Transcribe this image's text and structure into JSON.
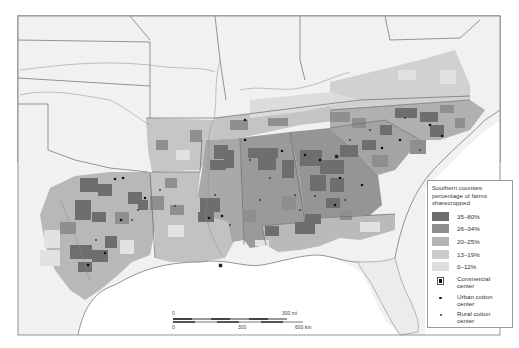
{
  "map": {
    "title": "Southern counties: percentage of farms sharecropped",
    "region": "Southern United States",
    "water_color": "#ffffff",
    "land_color": "#f2f2f2"
  },
  "legend": {
    "title_line1": "Southern counties:",
    "title_line2": "percentage of farms",
    "title_line3": "sharecropped",
    "classes": [
      {
        "label": "35–80%",
        "color": "#6e6e6e"
      },
      {
        "label": "26–34%",
        "color": "#8f8f8f"
      },
      {
        "label": "20–25%",
        "color": "#b4b4b4"
      },
      {
        "label": "13–19%",
        "color": "#cbcbcb"
      },
      {
        "label": "0–12%",
        "color": "#dedede"
      }
    ],
    "symbols": [
      {
        "icon": "commercial-center-icon",
        "label_line1": "Commercial",
        "label_line2": "center"
      },
      {
        "icon": "urban-cotton-center-icon",
        "label_line1": "Urban cotton",
        "label_line2": "center"
      },
      {
        "icon": "rural-cotton-center-icon",
        "label_line1": "Rural cotton",
        "label_line2": "center"
      }
    ]
  },
  "scale_bar": {
    "mi_zero": "0",
    "mi_end": "300 mi",
    "km_zero": "0",
    "km_mid": "300",
    "km_end": "600 km"
  }
}
